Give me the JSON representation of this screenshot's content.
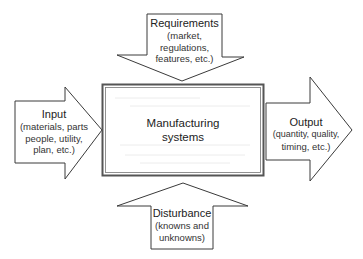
{
  "diagram": {
    "center": {
      "title_line1": "Manufacturing",
      "title_line2": "systems"
    },
    "requirements": {
      "title": "Requirements",
      "detail_lines": [
        "(market,",
        "regulations,",
        "features, etc.)"
      ],
      "direction": "down"
    },
    "input": {
      "title": "Input",
      "detail_lines": [
        "(materials, parts",
        "people, utility,",
        "plan, etc.)"
      ],
      "direction": "right"
    },
    "output": {
      "title": "Output",
      "detail_lines": [
        "(quantity, quality,",
        "timing, etc.)"
      ],
      "direction": "right"
    },
    "disturbance": {
      "title": "Disturbance",
      "detail_lines": [
        "(knowns and",
        "unknowns)"
      ],
      "direction": "up"
    },
    "colors": {
      "stroke": "#3a3a3a",
      "fill": "#ffffff",
      "text": "#222222"
    }
  }
}
